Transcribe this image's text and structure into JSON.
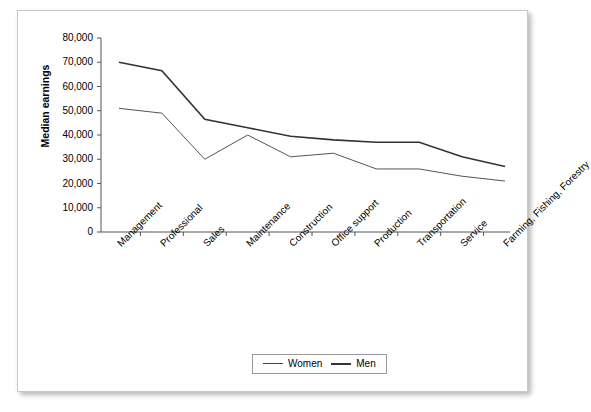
{
  "chart_data": {
    "type": "line",
    "title": "",
    "xlabel": "",
    "ylabel": "Median earnings",
    "ylim": [
      0,
      80000
    ],
    "grid": false,
    "legend_position": "bottom-center",
    "categories": [
      "Management",
      "Professional",
      "Sales",
      "Maintenance",
      "Construction",
      "Office support",
      "Production",
      "Transportation",
      "Service",
      "Farming, Fishing, Forestry"
    ],
    "ytick_labels": [
      "0",
      "10,000",
      "20,000",
      "30,000",
      "40,000",
      "50,000",
      "60,000",
      "70,000",
      "80,000"
    ],
    "ytick_values": [
      0,
      10000,
      20000,
      30000,
      40000,
      50000,
      60000,
      70000,
      80000
    ],
    "series": [
      {
        "name": "Women",
        "color": "#555555",
        "width": 1,
        "values": [
          51000,
          49000,
          30000,
          40000,
          31000,
          32500,
          26000,
          26000,
          23000,
          21000
        ]
      },
      {
        "name": "Men",
        "color": "#333333",
        "width": 1.6,
        "values": [
          70000,
          66500,
          46500,
          43000,
          39500,
          38000,
          37000,
          37000,
          31000,
          27000
        ]
      }
    ]
  },
  "legend": {
    "items": [
      {
        "label": "Women"
      },
      {
        "label": "Men"
      }
    ]
  }
}
